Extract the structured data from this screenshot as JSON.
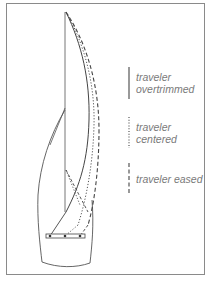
{
  "diagram": {
    "stroke_color": "#555555",
    "legend": [
      {
        "style": "solid",
        "label_line1": "traveler",
        "label_line2": "overtrimmed"
      },
      {
        "style": "dotted",
        "label_line1": "traveler",
        "label_line2": "centered"
      },
      {
        "style": "dashed",
        "label_line1": "traveler eased",
        "label_line2": ""
      }
    ]
  }
}
